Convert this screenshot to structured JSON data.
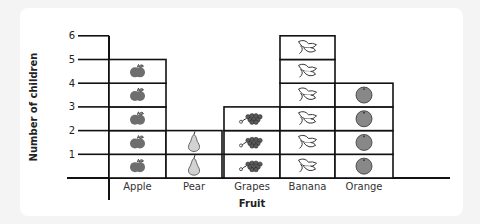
{
  "chart_data": {
    "type": "bar",
    "subtype": "pictogram",
    "title": "",
    "xlabel": "Fruit",
    "ylabel": "Number of children",
    "categories": [
      "Apple",
      "Pear",
      "Grapes",
      "Banana",
      "Orange"
    ],
    "values": [
      5,
      2,
      3,
      6,
      4
    ],
    "icons": [
      "apple-icon",
      "pear-icon",
      "grapes-icon",
      "banana-icon",
      "orange-icon"
    ],
    "yticks": [
      "1",
      "2",
      "3",
      "4",
      "5",
      "6"
    ],
    "ylim": [
      0,
      6
    ],
    "grid": false,
    "legend": null
  },
  "colors": {
    "apple": "#6e6e6e",
    "pear": "#d2d2d2",
    "grapes": "#5a5a5a",
    "orange": "#888888",
    "line": "#111111"
  }
}
